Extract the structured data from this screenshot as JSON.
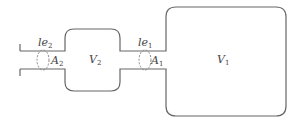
{
  "diagram": {
    "colors": {
      "stroke": "#666666",
      "dashed": "#888888",
      "text": "#444444",
      "background": "#ffffff"
    },
    "chambers": [
      {
        "id": "V1",
        "label_main": "V",
        "label_sub": "1"
      },
      {
        "id": "V2",
        "label_main": "V",
        "label_sub": "2"
      }
    ],
    "necks": [
      {
        "id": "neck1",
        "length_main": "le",
        "length_sub": "1",
        "area_main": "A",
        "area_sub": "1"
      },
      {
        "id": "neck2",
        "length_main": "le",
        "length_sub": "2",
        "area_main": "A",
        "area_sub": "2"
      }
    ]
  }
}
